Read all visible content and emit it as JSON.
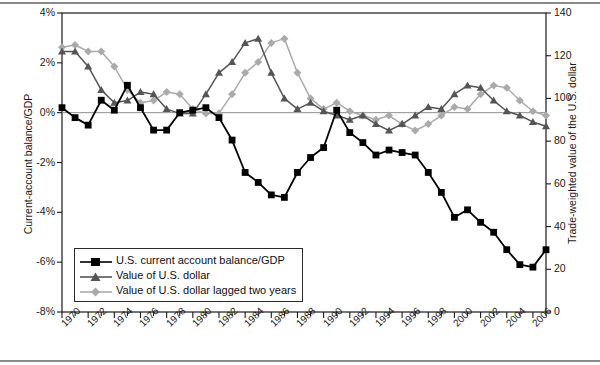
{
  "chart_data": {
    "type": "line",
    "title": "",
    "xlabel": "",
    "ylabel": "Current-account balance/GDP",
    "ylabel_right": "Trade-weighted value of the U.S. dollar",
    "grid": false,
    "legend_position": "inside-lower-left",
    "x": [
      1970,
      1971,
      1972,
      1973,
      1974,
      1975,
      1976,
      1977,
      1978,
      1979,
      1980,
      1981,
      1982,
      1983,
      1984,
      1985,
      1986,
      1987,
      1988,
      1989,
      1990,
      1991,
      1992,
      1993,
      1994,
      1995,
      1996,
      1997,
      1998,
      1999,
      2000,
      2001,
      2002,
      2003,
      2004,
      2005,
      2006,
      2007
    ],
    "xtick_labels": [
      "1970",
      "1972",
      "1974",
      "1976",
      "1978",
      "1980",
      "1982",
      "1984",
      "1986",
      "1988",
      "1990",
      "1992",
      "1994",
      "1996",
      "1998",
      "2000",
      "2002",
      "2004",
      "2006"
    ],
    "xlim": [
      1970,
      2007
    ],
    "ylim_left": [
      -8,
      4
    ],
    "ytick_labels_left": [
      "4%",
      "2%",
      "0%",
      "-2%",
      "-4%",
      "-6%",
      "-8%"
    ],
    "ytick_values_left": [
      4,
      2,
      0,
      -2,
      -4,
      -6,
      -8
    ],
    "ylim_right": [
      0,
      140
    ],
    "ytick_labels_right": [
      "140",
      "120",
      "100",
      "80",
      "60",
      "40",
      "20",
      "0"
    ],
    "ytick_values_right": [
      140,
      120,
      100,
      80,
      60,
      40,
      20,
      0
    ],
    "zero_reference_line": 0,
    "series": [
      {
        "name": "U.S. current account balance/GDP",
        "axis": "left",
        "color": "#000000",
        "marker": "square",
        "values": [
          0.2,
          -0.2,
          -0.5,
          0.5,
          0.1,
          1.1,
          0.2,
          -0.7,
          -0.7,
          0.0,
          0.1,
          0.2,
          -0.2,
          -1.1,
          -2.4,
          -2.8,
          -3.3,
          -3.4,
          -2.4,
          -1.8,
          -1.4,
          0.1,
          -0.8,
          -1.2,
          -1.7,
          -1.5,
          -1.6,
          -1.7,
          -2.4,
          -3.2,
          -4.2,
          -3.9,
          -4.4,
          -4.8,
          -5.5,
          -6.1,
          -6.2,
          -5.5
        ]
      },
      {
        "name": "Value of U.S. dollar",
        "axis": "right",
        "color": "#555555",
        "marker": "triangle",
        "values": [
          122,
          122,
          115,
          104,
          98,
          99,
          103,
          102,
          95,
          93,
          93,
          102,
          112,
          117,
          126,
          128,
          112,
          100,
          95,
          98,
          94,
          92,
          90,
          92,
          88,
          85,
          88,
          92,
          96,
          95,
          102,
          106,
          105,
          99,
          94,
          92,
          89,
          87
        ]
      },
      {
        "name": "Value of U.S. dollar lagged two years",
        "axis": "right",
        "color": "#aaaaaa",
        "marker": "diamond",
        "values": [
          124,
          125,
          122,
          122,
          115,
          104,
          98,
          99,
          103,
          102,
          95,
          93,
          93,
          102,
          112,
          117,
          126,
          128,
          112,
          100,
          95,
          98,
          94,
          92,
          90,
          92,
          88,
          85,
          88,
          92,
          96,
          95,
          102,
          106,
          105,
          99,
          94,
          92
        ]
      }
    ]
  },
  "legend": {
    "items": [
      {
        "label": "U.S. current account balance/GDP"
      },
      {
        "label": "Value of U.S. dollar"
      },
      {
        "label": "Value of U.S. dollar lagged two years"
      }
    ]
  }
}
